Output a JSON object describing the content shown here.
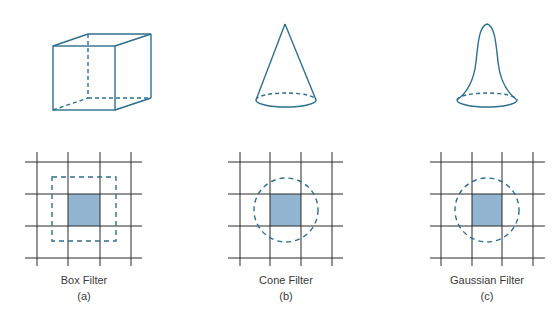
{
  "figure": {
    "colors": {
      "shape_stroke": "#2e6f8e",
      "grid_line": "#2b2b2b",
      "pixel_fill": "#92b6d2",
      "dashed_region": "#2e6f8e",
      "label_text": "#3a3a3a"
    },
    "panels": [
      {
        "id": "a",
        "title": "Box Filter",
        "sublabel": "(a)",
        "shape": "box-3d",
        "region": "square"
      },
      {
        "id": "b",
        "title": "Cone Filter",
        "sublabel": "(b)",
        "shape": "cone",
        "region": "circle"
      },
      {
        "id": "c",
        "title": "Gaussian Filter",
        "sublabel": "(c)",
        "shape": "gaussian-bell",
        "region": "circle"
      }
    ]
  }
}
